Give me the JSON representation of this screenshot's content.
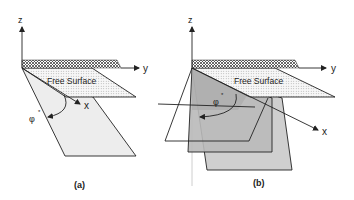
{
  "figure": {
    "panels": [
      {
        "id": "a",
        "caption": "(a)",
        "axes": {
          "z": "z",
          "y": "y",
          "x": "x"
        },
        "surface_label": "Free Surface",
        "angle_label": "φ",
        "angle_superscript": "*"
      },
      {
        "id": "b",
        "caption": "(b)",
        "axes": {
          "z": "z",
          "y": "y",
          "x": "x"
        },
        "surface_label": "Free Surface",
        "angle_label": "φ",
        "angle_superscript": "*"
      }
    ],
    "colors": {
      "line": "#222222",
      "plane_light": "#ececec",
      "plane_mid": "#bdbdbd",
      "plane_dark": "#a9a9a9",
      "surface_dots": "#f4f4f4",
      "hatch": "#555555"
    }
  }
}
